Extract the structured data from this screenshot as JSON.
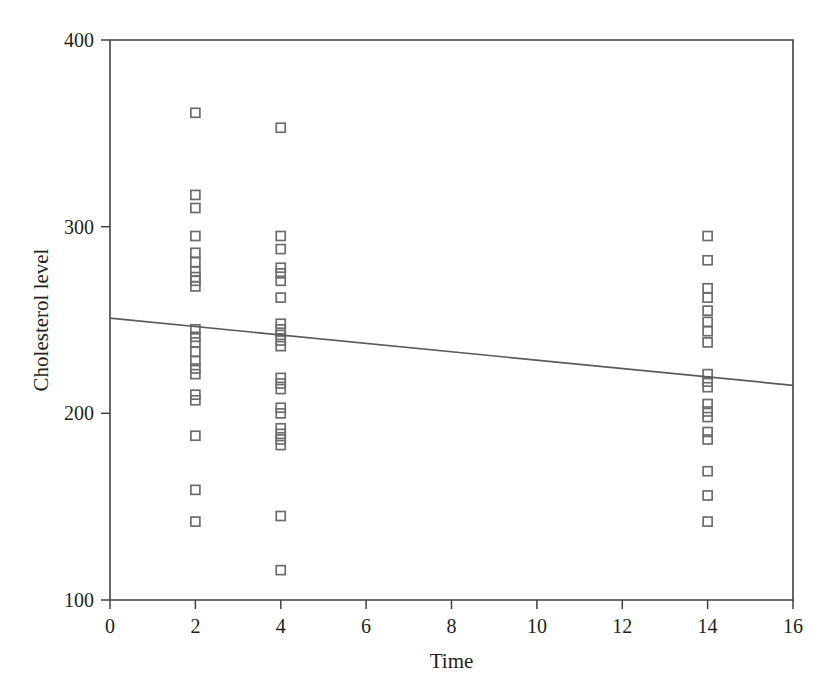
{
  "chart_data": {
    "type": "scatter",
    "title": "",
    "xlabel": "Time",
    "ylabel": "Cholesterol level",
    "xlim": [
      0,
      16
    ],
    "ylim": [
      100,
      400
    ],
    "xticks": [
      0,
      2,
      4,
      6,
      8,
      10,
      12,
      14,
      16
    ],
    "xtick_labels": [
      "0",
      "2",
      "4",
      "6",
      "8",
      "10",
      "12",
      "14",
      "16"
    ],
    "yticks": [
      100,
      200,
      300,
      400
    ],
    "ytick_labels": [
      "100",
      "200",
      "300",
      "400"
    ],
    "grid": false,
    "legend": null,
    "marker": "open-square",
    "marker_color": "#6f6c6d",
    "line_color": "#5d5a5b",
    "series": [
      {
        "name": "Cholesterol level observations",
        "marker": "open-square",
        "points": [
          [
            2,
            361
          ],
          [
            2,
            317
          ],
          [
            2,
            310
          ],
          [
            2,
            295
          ],
          [
            2,
            286
          ],
          [
            2,
            281
          ],
          [
            2,
            276
          ],
          [
            2,
            273
          ],
          [
            2,
            271
          ],
          [
            2,
            268
          ],
          [
            2,
            245
          ],
          [
            2,
            241
          ],
          [
            2,
            238
          ],
          [
            2,
            233
          ],
          [
            2,
            228
          ],
          [
            2,
            224
          ],
          [
            2,
            221
          ],
          [
            2,
            210
          ],
          [
            2,
            207
          ],
          [
            2,
            188
          ],
          [
            2,
            159
          ],
          [
            2,
            142
          ],
          [
            4,
            353
          ],
          [
            4,
            295
          ],
          [
            4,
            288
          ],
          [
            4,
            278
          ],
          [
            4,
            275
          ],
          [
            4,
            271
          ],
          [
            4,
            262
          ],
          [
            4,
            248
          ],
          [
            4,
            245
          ],
          [
            4,
            242
          ],
          [
            4,
            239
          ],
          [
            4,
            236
          ],
          [
            4,
            219
          ],
          [
            4,
            216
          ],
          [
            4,
            213
          ],
          [
            4,
            203
          ],
          [
            4,
            200
          ],
          [
            4,
            192
          ],
          [
            4,
            189
          ],
          [
            4,
            186
          ],
          [
            4,
            183
          ],
          [
            4,
            145
          ],
          [
            4,
            116
          ],
          [
            14,
            295
          ],
          [
            14,
            282
          ],
          [
            14,
            267
          ],
          [
            14,
            262
          ],
          [
            14,
            255
          ],
          [
            14,
            249
          ],
          [
            14,
            244
          ],
          [
            14,
            238
          ],
          [
            14,
            221
          ],
          [
            14,
            217
          ],
          [
            14,
            214
          ],
          [
            14,
            205
          ],
          [
            14,
            201
          ],
          [
            14,
            198
          ],
          [
            14,
            190
          ],
          [
            14,
            186
          ],
          [
            14,
            169
          ],
          [
            14,
            156
          ],
          [
            14,
            142
          ]
        ]
      }
    ],
    "trendline": {
      "name": "linear fit",
      "x": [
        0,
        16
      ],
      "y": [
        251,
        215
      ],
      "intercept": 251,
      "slope": -2.25
    }
  }
}
